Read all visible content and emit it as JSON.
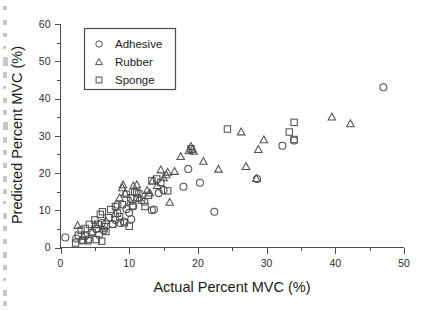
{
  "chart_data": {
    "type": "scatter",
    "title": "",
    "xlabel": "Actual Percent MVC (%)",
    "ylabel": "Predicted Percent MVC (%)",
    "xlim": [
      0,
      50
    ],
    "ylim": [
      0,
      60
    ],
    "xticks": [
      0,
      10,
      20,
      30,
      40,
      50
    ],
    "yticks": [
      0,
      10,
      20,
      30,
      40,
      50,
      60
    ],
    "xtick_labels": [
      "0",
      "10",
      "20",
      "30",
      "40",
      "50"
    ],
    "ytick_labels": [
      "0",
      "10",
      "20",
      "30",
      "40",
      "50",
      "60"
    ],
    "x_minor_interval": 5,
    "y_minor_interval": 5,
    "grid": false,
    "legend_position": "upper-left-inside",
    "marker_color": "#515151",
    "axis_color": "#4d4d4d",
    "series": [
      {
        "name": "Adhesive",
        "marker": "circle",
        "points": [
          [
            0.7,
            2.7
          ],
          [
            2.3,
            2.4
          ],
          [
            3.1,
            1.9
          ],
          [
            3.6,
            3.1
          ],
          [
            4.1,
            2.2
          ],
          [
            5.2,
            5.0
          ],
          [
            5.6,
            3.4
          ],
          [
            6.0,
            6.6
          ],
          [
            6.3,
            4.6
          ],
          [
            7.6,
            6.3
          ],
          [
            8.0,
            7.4
          ],
          [
            8.3,
            11.5
          ],
          [
            8.7,
            6.6
          ],
          [
            9.2,
            7.0
          ],
          [
            9.6,
            10.3
          ],
          [
            10.0,
            9.3
          ],
          [
            10.3,
            7.6
          ],
          [
            10.6,
            11.1
          ],
          [
            11.2,
            13.2
          ],
          [
            12.2,
            12.3
          ],
          [
            13.3,
            10.0
          ],
          [
            13.6,
            10.2
          ],
          [
            14.3,
            14.6
          ],
          [
            15.0,
            15.4
          ],
          [
            17.9,
            16.3
          ],
          [
            18.6,
            21.1
          ],
          [
            20.3,
            17.4
          ],
          [
            22.4,
            9.6
          ],
          [
            28.6,
            18.4
          ],
          [
            32.3,
            27.3
          ],
          [
            34.0,
            28.7
          ],
          [
            47.0,
            43.0
          ]
        ]
      },
      {
        "name": "Rubber",
        "marker": "triangle",
        "points": [
          [
            2.5,
            5.9
          ],
          [
            3.3,
            3.0
          ],
          [
            4.6,
            4.2
          ],
          [
            5.0,
            6.1
          ],
          [
            6.1,
            5.0
          ],
          [
            6.6,
            7.2
          ],
          [
            8.0,
            9.1
          ],
          [
            8.6,
            13.3
          ],
          [
            9.0,
            16.0
          ],
          [
            9.1,
            16.8
          ],
          [
            9.4,
            14.6
          ],
          [
            10.2,
            12.4
          ],
          [
            10.6,
            16.5
          ],
          [
            11.1,
            16.8
          ],
          [
            11.5,
            13.3
          ],
          [
            12.6,
            15.3
          ],
          [
            13.0,
            14.6
          ],
          [
            13.4,
            17.8
          ],
          [
            14.1,
            16.6
          ],
          [
            14.6,
            20.8
          ],
          [
            15.0,
            18.7
          ],
          [
            15.4,
            19.5
          ],
          [
            15.6,
            20.2
          ],
          [
            15.9,
            12.1
          ],
          [
            16.6,
            20.4
          ],
          [
            17.5,
            24.4
          ],
          [
            18.7,
            26.0
          ],
          [
            19.0,
            27.1
          ],
          [
            19.2,
            26.3
          ],
          [
            19.4,
            25.8
          ],
          [
            20.8,
            23.1
          ],
          [
            23.0,
            21.0
          ],
          [
            26.3,
            31.0
          ],
          [
            27.0,
            21.7
          ],
          [
            28.5,
            18.5
          ],
          [
            28.8,
            26.3
          ],
          [
            29.6,
            28.9
          ],
          [
            39.5,
            35.0
          ],
          [
            42.2,
            33.2
          ]
        ]
      },
      {
        "name": "Sponge",
        "marker": "square",
        "points": [
          [
            2.2,
            1.2
          ],
          [
            2.6,
            3.3
          ],
          [
            3.0,
            4.6
          ],
          [
            3.3,
            2.0
          ],
          [
            3.6,
            5.1
          ],
          [
            4.0,
            1.8
          ],
          [
            4.2,
            6.2
          ],
          [
            4.6,
            4.0
          ],
          [
            5.0,
            7.4
          ],
          [
            5.2,
            2.1
          ],
          [
            5.5,
            6.2
          ],
          [
            5.8,
            8.9
          ],
          [
            6.0,
            1.7
          ],
          [
            6.1,
            9.6
          ],
          [
            6.4,
            5.6
          ],
          [
            6.6,
            4.3
          ],
          [
            7.0,
            8.0
          ],
          [
            7.3,
            10.2
          ],
          [
            7.6,
            6.2
          ],
          [
            8.0,
            11.0
          ],
          [
            8.3,
            9.2
          ],
          [
            8.6,
            8.3
          ],
          [
            9.0,
            11.5
          ],
          [
            9.3,
            6.6
          ],
          [
            9.6,
            14.3
          ],
          [
            10.0,
            5.7
          ],
          [
            10.2,
            13.3
          ],
          [
            10.5,
            11.2
          ],
          [
            10.8,
            15.0
          ],
          [
            11.1,
            14.8
          ],
          [
            11.4,
            14.4
          ],
          [
            11.8,
            12.7
          ],
          [
            12.3,
            11.0
          ],
          [
            12.8,
            14.0
          ],
          [
            13.3,
            17.9
          ],
          [
            14.0,
            18.4
          ],
          [
            14.6,
            17.5
          ],
          [
            15.6,
            15.2
          ],
          [
            19.0,
            26.5
          ],
          [
            24.3,
            31.8
          ],
          [
            33.3,
            31.0
          ],
          [
            34.0,
            33.6
          ],
          [
            34.0,
            29.0
          ]
        ]
      }
    ]
  },
  "legend": {
    "items": [
      {
        "label": "Adhesive",
        "marker": "circle"
      },
      {
        "label": "Rubber",
        "marker": "triangle"
      },
      {
        "label": "Sponge",
        "marker": "square"
      }
    ]
  }
}
